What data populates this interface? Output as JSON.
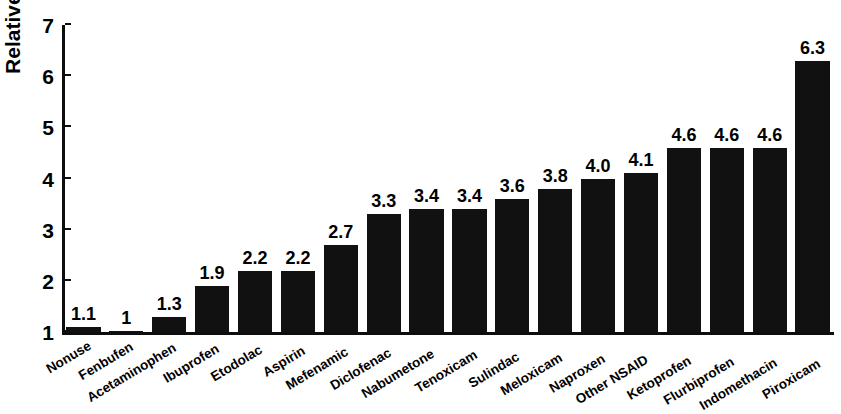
{
  "chart_data": {
    "type": "bar",
    "title": "",
    "xlabel": "",
    "ylabel": "Relative risk",
    "ylim": [
      1,
      7
    ],
    "yticks": [
      1,
      2,
      3,
      4,
      5,
      6,
      7
    ],
    "ytick_labels": [
      "1",
      "2",
      "3",
      "4",
      "5",
      "6",
      "7"
    ],
    "grid": false,
    "legend": null,
    "orientation": "vertical",
    "bar_color": "#111111",
    "categories": [
      "Nonuse",
      "Fenbufen",
      "Acetaminophen",
      "Ibuprofen",
      "Etodolac",
      "Aspirin",
      "Mefenamic",
      "Diclofenac",
      "Nabumetone",
      "Tenoxicam",
      "Sulindac",
      "Meloxicam",
      "Naproxen",
      "Other NSAID",
      "Ketoprofen",
      "Flurbiprofen",
      "Indomethacin",
      "Piroxicam"
    ],
    "values": [
      1.1,
      1,
      1.3,
      1.9,
      2.2,
      2.2,
      2.7,
      3.3,
      3.4,
      3.4,
      3.6,
      3.8,
      4.0,
      4.1,
      4.6,
      4.6,
      4.6,
      6.3
    ],
    "data_labels": [
      "1.1",
      "1",
      "1.3",
      "1.9",
      "2.2",
      "2.2",
      "2.7",
      "3.3",
      "3.4",
      "3.4",
      "3.6",
      "3.8",
      "4.0",
      "4.1",
      "4.6",
      "4.6",
      "4.6",
      "6.3"
    ]
  }
}
